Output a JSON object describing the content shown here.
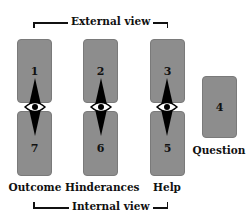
{
  "top_bracket": {
    "label": "External view"
  },
  "bottom_bracket": {
    "label": "Internal view"
  },
  "columns": [
    {
      "top_card": "1",
      "bottom_card": "7",
      "label": "Outcome"
    },
    {
      "top_card": "2",
      "bottom_card": "6",
      "label": "Hinderances"
    },
    {
      "top_card": "3",
      "bottom_card": "5",
      "label": "Help"
    }
  ],
  "question_card": {
    "number": "4",
    "label": "Question"
  },
  "colors": {
    "card": "#8d8d8d",
    "ink": "#111111"
  }
}
